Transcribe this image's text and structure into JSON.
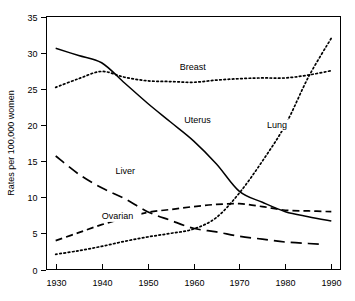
{
  "chart_data": {
    "type": "line",
    "title": "",
    "xlabel": "",
    "ylabel": "Rates per 100,000 women",
    "xlim": [
      1928,
      1992
    ],
    "ylim": [
      0,
      35
    ],
    "xticks": [
      1930,
      1940,
      1950,
      1960,
      1970,
      1980,
      1990
    ],
    "yticks": [
      0,
      5,
      10,
      15,
      20,
      25,
      30,
      35
    ],
    "xtick_labels": [
      "1930",
      "1940",
      "1950",
      "1960",
      "1970",
      "1980",
      "1990"
    ],
    "ytick_labels": [
      "0",
      "5",
      "10",
      "15",
      "20",
      "25",
      "30",
      "35"
    ],
    "grid": false,
    "legend": "inline-annotations",
    "series": [
      {
        "name": "Uterus",
        "style": "solid",
        "label": "Uterus",
        "label_x": 1958,
        "label_y": 20.2,
        "x": [
          1930,
          1935,
          1940,
          1945,
          1950,
          1955,
          1960,
          1965,
          1970,
          1975,
          1980,
          1985,
          1990
        ],
        "values": [
          30.6,
          29.6,
          28.6,
          25.8,
          23.0,
          20.4,
          17.8,
          14.6,
          10.8,
          9.3,
          8.0,
          7.3,
          6.7
        ]
      },
      {
        "name": "Breast",
        "style": "dotted",
        "label": "Breast",
        "label_x": 1957,
        "label_y": 27.6,
        "x": [
          1930,
          1935,
          1940,
          1945,
          1950,
          1955,
          1960,
          1965,
          1970,
          1975,
          1980,
          1985,
          1990
        ],
        "values": [
          25.2,
          26.4,
          27.4,
          26.6,
          26.1,
          26.0,
          25.9,
          26.2,
          26.4,
          26.5,
          26.5,
          26.9,
          27.5
        ]
      },
      {
        "name": "Lung",
        "style": "dotted",
        "label": "Lung",
        "label_x": 1976,
        "label_y": 19.6,
        "x": [
          1930,
          1935,
          1940,
          1945,
          1950,
          1955,
          1960,
          1965,
          1970,
          1975,
          1980,
          1985,
          1990
        ],
        "values": [
          2.1,
          2.6,
          3.2,
          3.9,
          4.5,
          5.0,
          5.6,
          7.2,
          10.6,
          15.0,
          20.0,
          26.6,
          32.0
        ]
      },
      {
        "name": "Liver",
        "style": "long-dash",
        "label": "Liver",
        "label_x": 1943,
        "label_y": 13.2,
        "x": [
          1930,
          1935,
          1940,
          1945,
          1950,
          1955,
          1960,
          1965,
          1970,
          1975,
          1980,
          1985,
          1988
        ],
        "values": [
          15.7,
          13.2,
          11.3,
          9.8,
          8.0,
          6.8,
          5.7,
          5.2,
          4.6,
          4.2,
          3.8,
          3.6,
          3.5
        ]
      },
      {
        "name": "Ovarian",
        "style": "dash",
        "label": "Ovarian",
        "label_x": 1940,
        "label_y": 7.0,
        "x": [
          1930,
          1935,
          1940,
          1945,
          1950,
          1955,
          1960,
          1965,
          1970,
          1975,
          1980,
          1985,
          1990
        ],
        "values": [
          4.0,
          5.1,
          6.2,
          7.1,
          7.9,
          8.3,
          8.7,
          9.0,
          9.1,
          8.7,
          8.2,
          8.1,
          8.0
        ]
      }
    ]
  }
}
